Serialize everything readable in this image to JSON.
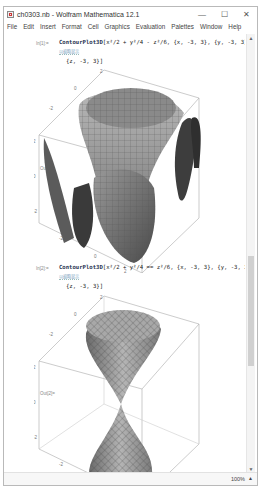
{
  "window": {
    "title": "ch0303.nb - Wolfram Mathematica 12.1",
    "minimize": "—",
    "maximize": "☐",
    "close": "✕"
  },
  "menu": [
    "File",
    "Edit",
    "Insert",
    "Format",
    "Cell",
    "Graphics",
    "Evaluation",
    "Palettes",
    "Window",
    "Help"
  ],
  "cells": [
    {
      "in_label": "In[1]:=",
      "function": "ContourPlot3D",
      "code_line1": "[x²/2 + y²/4 - z²/6, {x, -3, 3}, {y, -3, 3},",
      "code_line2": "{z, -3, 3}]",
      "hint": "以缩略显示",
      "out_label": "Out[1]=",
      "axis_ticks": [
        "2",
        "0",
        "-2",
        "2",
        "0",
        "-2",
        "-2",
        "0",
        "2"
      ],
      "surface": "hyperboloid-family"
    },
    {
      "in_label": "In[2]:=",
      "function": "ContourPlot3D",
      "code_line1": "[x²/2 + y²/4 == z²/6, {x, -3, 3}, {y, -3, 3},",
      "code_line2": "{z, -3, 3}]",
      "hint": "以缩略显示",
      "out_label": "Out[2]=",
      "axis_ticks": [
        "2",
        "0",
        "-2",
        "2",
        "0",
        "-2",
        "-2",
        "0",
        "2"
      ],
      "surface": "double-cone"
    }
  ],
  "status": {
    "zoom": "100%",
    "zoom_arrow": "▲"
  },
  "scroll": {
    "up": "▲",
    "down": "▼"
  }
}
